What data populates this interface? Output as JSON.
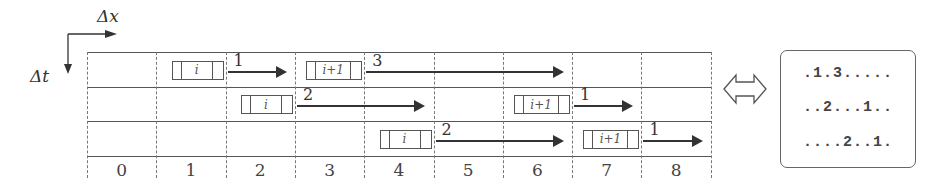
{
  "axes": {
    "x_label": "Δx",
    "t_label": "Δt"
  },
  "columns": [
    "0",
    "1",
    "2",
    "3",
    "4",
    "5",
    "6",
    "7",
    "8"
  ],
  "rows": [
    {
      "blocks": [
        {
          "label": "i",
          "col": 1,
          "arrow_length": 1,
          "arrow_label": "1"
        },
        {
          "label": "i+1",
          "col": 3,
          "arrow_length": 3,
          "arrow_label": "3"
        }
      ]
    },
    {
      "blocks": [
        {
          "label": "i",
          "col": 2,
          "arrow_length": 2,
          "arrow_label": "2"
        },
        {
          "label": "i+1",
          "col": 6,
          "arrow_length": 1,
          "arrow_label": "1"
        }
      ]
    },
    {
      "blocks": [
        {
          "label": "i",
          "col": 4,
          "arrow_length": 2,
          "arrow_label": "2"
        },
        {
          "label": "i+1",
          "col": 7,
          "arrow_length": 1,
          "arrow_label": "1"
        }
      ]
    }
  ],
  "equivalence_symbol": "⇔",
  "encoding": {
    "lines": [
      ".1.3.....",
      "..2...1..",
      "....2..1."
    ]
  }
}
